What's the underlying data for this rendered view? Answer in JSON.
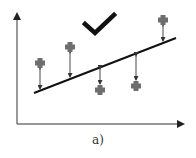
{
  "figure": {
    "caption": "a)",
    "check_mark": "check-icon",
    "colors": {
      "axis": "#333333",
      "line": "#111111",
      "point": "#6e6e6e",
      "residual": "#333333",
      "check": "#111111"
    },
    "regression_line": {
      "x1": 34,
      "y1": 93,
      "x2": 176,
      "y2": 38
    },
    "points": [
      {
        "x": 40,
        "y": 63,
        "line_y": 91,
        "side": "above"
      },
      {
        "x": 70,
        "y": 47,
        "line_y": 79,
        "side": "above"
      },
      {
        "x": 100,
        "y": 90,
        "line_y": 67,
        "side": "below"
      },
      {
        "x": 136,
        "y": 86,
        "line_y": 54,
        "side": "below"
      },
      {
        "x": 163,
        "y": 20,
        "line_y": 43,
        "side": "above"
      }
    ]
  }
}
